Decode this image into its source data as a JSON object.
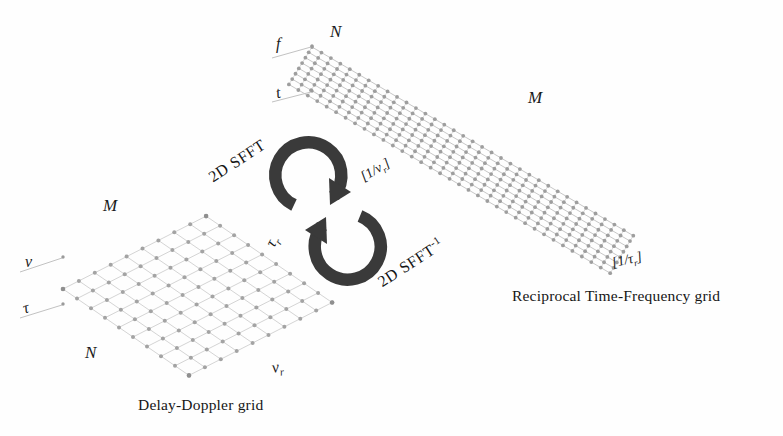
{
  "figure": {
    "background_color": "#fefefe",
    "grid_line_color": "#c9c9c9",
    "grid_node_color": "#9a9a9a",
    "arrow_color": "#3a3a3a",
    "text_color": "#1a1a1a"
  },
  "delay_doppler": {
    "caption": "Delay-Doppler grid",
    "axis_label_nu": "ν",
    "axis_label_tau": "τ",
    "label_M": "M",
    "label_N": "N",
    "edge_label_tau_r": "τ",
    "edge_label_tau_r_sub": "r",
    "edge_label_nu_r": "ν",
    "edge_label_nu_r_sub": "r",
    "rows": 9,
    "cols": 9
  },
  "reciprocal_tf": {
    "caption": "Reciprocal Time-Frequency grid",
    "axis_label_f": "f",
    "axis_label_t": "t",
    "label_N": "N",
    "label_M": "M",
    "bracket_left": "[1/ν",
    "bracket_left_sub": "r",
    "bracket_left_end": "]",
    "bracket_right": "[1/τ",
    "bracket_right_sub": "r",
    "bracket_right_end": "]",
    "dense_lines": 34,
    "sparse_lines": 7
  },
  "transform": {
    "forward_label": "2D SFFT",
    "inverse_label": "2D SFFT",
    "inverse_exponent": "-1",
    "forward_direction": "clockwise-top",
    "inverse_direction": "clockwise-bottom"
  }
}
